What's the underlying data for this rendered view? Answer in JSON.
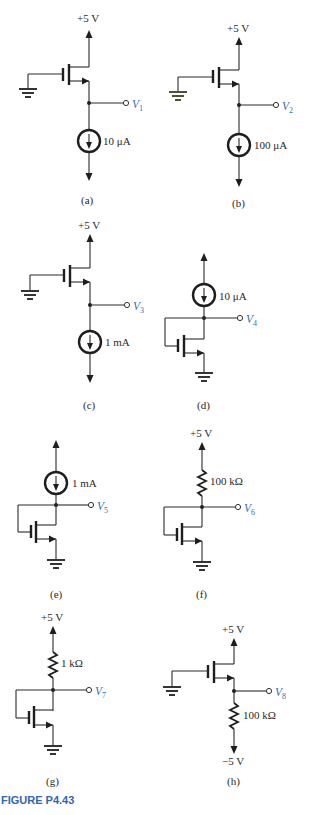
{
  "figure": {
    "title": "FIGURE P4.43",
    "title_color": "#2e67b5",
    "label_color": "#2f6fb3"
  },
  "circuits": [
    {
      "id": "a",
      "caption": "(a)",
      "supply": "+5 V",
      "output_var": "V",
      "output_sub": "1",
      "element": "current source",
      "element_value": "10 μA",
      "config": "source follower, gate grounded"
    },
    {
      "id": "b",
      "caption": "(b)",
      "supply": "+5 V",
      "output_var": "V",
      "output_sub": "2",
      "element": "current source",
      "element_value": "100 μA",
      "config": "source follower, gate grounded"
    },
    {
      "id": "c",
      "caption": "(c)",
      "supply": "+5 V",
      "output_var": "V",
      "output_sub": "3",
      "element": "current source",
      "element_value": "1 mA",
      "config": "source follower, gate grounded"
    },
    {
      "id": "d",
      "caption": "(d)",
      "supply": "",
      "output_var": "V",
      "output_sub": "4",
      "element": "current source",
      "element_value": "10 μA",
      "config": "diode-connected, source grounded"
    },
    {
      "id": "e",
      "caption": "(e)",
      "supply": "",
      "output_var": "V",
      "output_sub": "5",
      "element": "current source",
      "element_value": "1 mA",
      "config": "diode-connected, source grounded"
    },
    {
      "id": "f",
      "caption": "(f)",
      "supply": "+5 V",
      "output_var": "V",
      "output_sub": "6",
      "element": "resistor",
      "element_value": "100 kΩ",
      "config": "diode-connected, source grounded"
    },
    {
      "id": "g",
      "caption": "(g)",
      "supply": "+5 V",
      "output_var": "V",
      "output_sub": "7",
      "element": "resistor",
      "element_value": "1 kΩ",
      "config": "diode-connected, source grounded"
    },
    {
      "id": "h",
      "caption": "(h)",
      "supply": "+5 V",
      "supply_neg": "−5 V",
      "output_var": "V",
      "output_sub": "8",
      "element": "resistor",
      "element_value": "100 kΩ",
      "config": "source follower, gate grounded"
    }
  ]
}
